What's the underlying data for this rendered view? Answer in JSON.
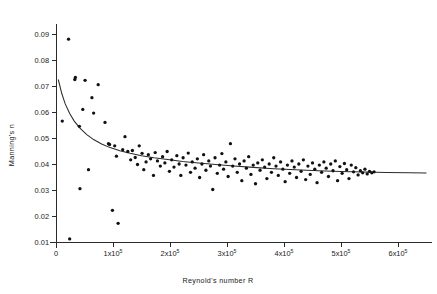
{
  "chart_data": {
    "type": "scatter",
    "title": "",
    "xlabel": "Reynold's number  R",
    "ylabel": "Manning's n",
    "xlim": [
      0,
      650000
    ],
    "ylim": [
      0.008,
      0.094
    ],
    "grid": false,
    "legend": false,
    "x_ticks": [
      {
        "value": 0,
        "label": "0",
        "mantissa": "",
        "exponent": ""
      },
      {
        "value": 100000,
        "label": "1x10",
        "mantissa": "1x10",
        "exponent": "5"
      },
      {
        "value": 200000,
        "label": "2x10",
        "mantissa": "2x10",
        "exponent": "5"
      },
      {
        "value": 300000,
        "label": "3x10",
        "mantissa": "3x10",
        "exponent": "5"
      },
      {
        "value": 400000,
        "label": "4x10",
        "mantissa": "4x10",
        "exponent": "5"
      },
      {
        "value": 500000,
        "label": "5x10",
        "mantissa": "5x10",
        "exponent": "5"
      },
      {
        "value": 600000,
        "label": "6x10",
        "mantissa": "6x10",
        "exponent": "5"
      }
    ],
    "y_ticks": [
      {
        "value": 0.01,
        "label": "0.01"
      },
      {
        "value": 0.02,
        "label": "0.02"
      },
      {
        "value": 0.03,
        "label": "0.03"
      },
      {
        "value": 0.04,
        "label": "0.04"
      },
      {
        "value": 0.05,
        "label": "0.05"
      },
      {
        "value": 0.06,
        "label": "0.06"
      },
      {
        "value": 0.07,
        "label": "0.07"
      },
      {
        "value": 0.08,
        "label": "0.08"
      },
      {
        "value": 0.09,
        "label": "0.09"
      }
    ],
    "series": [
      {
        "name": "Manning's n observations",
        "marker": "circle",
        "color": "#111111",
        "points": [
          [
            11000,
            0.0565
          ],
          [
            22000,
            0.088
          ],
          [
            24000,
            0.0112
          ],
          [
            33000,
            0.0725
          ],
          [
            34000,
            0.0733
          ],
          [
            41000,
            0.0545
          ],
          [
            42000,
            0.0305
          ],
          [
            47000,
            0.061
          ],
          [
            51000,
            0.0722
          ],
          [
            57000,
            0.0378
          ],
          [
            63000,
            0.0655
          ],
          [
            66000,
            0.0596
          ],
          [
            74000,
            0.0705
          ],
          [
            86000,
            0.056
          ],
          [
            92000,
            0.0478
          ],
          [
            94000,
            0.0475
          ],
          [
            99000,
            0.0222
          ],
          [
            103000,
            0.047
          ],
          [
            106000,
            0.043
          ],
          [
            109000,
            0.0172
          ],
          [
            117000,
            0.0455
          ],
          [
            121000,
            0.0505
          ],
          [
            126000,
            0.0448
          ],
          [
            131000,
            0.0416
          ],
          [
            134000,
            0.0452
          ],
          [
            139000,
            0.0425
          ],
          [
            143000,
            0.0398
          ],
          [
            146000,
            0.047
          ],
          [
            151000,
            0.0441
          ],
          [
            154000,
            0.0378
          ],
          [
            158000,
            0.0408
          ],
          [
            162000,
            0.0436
          ],
          [
            166000,
            0.042
          ],
          [
            171000,
            0.0356
          ],
          [
            174000,
            0.0444
          ],
          [
            178000,
            0.0412
          ],
          [
            183000,
            0.0392
          ],
          [
            187000,
            0.0428
          ],
          [
            191000,
            0.0404
          ],
          [
            195000,
            0.0448
          ],
          [
            199000,
            0.0372
          ],
          [
            203000,
            0.0416
          ],
          [
            207000,
            0.0388
          ],
          [
            212000,
            0.0432
          ],
          [
            216000,
            0.04
          ],
          [
            219000,
            0.0356
          ],
          [
            223000,
            0.0424
          ],
          [
            228000,
            0.0396
          ],
          [
            232000,
            0.0442
          ],
          [
            236000,
            0.0368
          ],
          [
            239000,
            0.0408
          ],
          [
            244000,
            0.0384
          ],
          [
            248000,
            0.042
          ],
          [
            252000,
            0.0348
          ],
          [
            256000,
            0.04
          ],
          [
            259000,
            0.0436
          ],
          [
            263000,
            0.0376
          ],
          [
            268000,
            0.0412
          ],
          [
            271000,
            0.0392
          ],
          [
            275000,
            0.0302
          ],
          [
            279000,
            0.0424
          ],
          [
            283000,
            0.0364
          ],
          [
            287000,
            0.0396
          ],
          [
            291000,
            0.044
          ],
          [
            294000,
            0.038
          ],
          [
            298000,
            0.0408
          ],
          [
            302000,
            0.0352
          ],
          [
            306000,
            0.0478
          ],
          [
            310000,
            0.0392
          ],
          [
            314000,
            0.042
          ],
          [
            318000,
            0.0368
          ],
          [
            322000,
            0.04
          ],
          [
            326000,
            0.0336
          ],
          [
            330000,
            0.0412
          ],
          [
            334000,
            0.0384
          ],
          [
            338000,
            0.0428
          ],
          [
            342000,
            0.036
          ],
          [
            346000,
            0.0396
          ],
          [
            350000,
            0.0324
          ],
          [
            354000,
            0.0404
          ],
          [
            358000,
            0.0376
          ],
          [
            362000,
            0.0416
          ],
          [
            366000,
            0.0388
          ],
          [
            370000,
            0.0344
          ],
          [
            374000,
            0.04
          ],
          [
            378000,
            0.0368
          ],
          [
            382000,
            0.0424
          ],
          [
            386000,
            0.0392
          ],
          [
            390000,
            0.0356
          ],
          [
            394000,
            0.0408
          ],
          [
            398000,
            0.038
          ],
          [
            402000,
            0.0332
          ],
          [
            406000,
            0.0396
          ],
          [
            410000,
            0.0364
          ],
          [
            414000,
            0.0412
          ],
          [
            418000,
            0.0388
          ],
          [
            422000,
            0.0348
          ],
          [
            426000,
            0.04
          ],
          [
            430000,
            0.0372
          ],
          [
            434000,
            0.0416
          ],
          [
            438000,
            0.034
          ],
          [
            442000,
            0.0392
          ],
          [
            446000,
            0.036
          ],
          [
            450000,
            0.0404
          ],
          [
            454000,
            0.038
          ],
          [
            458000,
            0.0328
          ],
          [
            462000,
            0.0396
          ],
          [
            466000,
            0.0368
          ],
          [
            470000,
            0.0408
          ],
          [
            474000,
            0.0384
          ],
          [
            478000,
            0.0352
          ],
          [
            482000,
            0.04
          ],
          [
            486000,
            0.0374
          ],
          [
            490000,
            0.0412
          ],
          [
            494000,
            0.0336
          ],
          [
            498000,
            0.039
          ],
          [
            502000,
            0.0364
          ],
          [
            506000,
            0.0402
          ],
          [
            510000,
            0.0378
          ],
          [
            514000,
            0.0344
          ],
          [
            518000,
            0.0396
          ],
          [
            522000,
            0.037
          ],
          [
            526000,
            0.0386
          ],
          [
            530000,
            0.0358
          ],
          [
            534000,
            0.0374
          ],
          [
            538000,
            0.0366
          ],
          [
            542000,
            0.038
          ],
          [
            546000,
            0.0362
          ],
          [
            550000,
            0.0372
          ],
          [
            554000,
            0.0366
          ],
          [
            558000,
            0.037
          ]
        ]
      }
    ],
    "fit_curve": {
      "name": "fitted decay curve",
      "color": "#2b2b2b",
      "asymptote": 0.0365,
      "start_value": 0.0725,
      "points": [
        [
          4000,
          0.0725
        ],
        [
          10000,
          0.0672
        ],
        [
          16000,
          0.0632
        ],
        [
          24000,
          0.0594
        ],
        [
          32000,
          0.0565
        ],
        [
          42000,
          0.0538
        ],
        [
          54000,
          0.0513
        ],
        [
          66000,
          0.0494
        ],
        [
          80000,
          0.0477
        ],
        [
          95000,
          0.0463
        ],
        [
          112000,
          0.0451
        ],
        [
          130000,
          0.0441
        ],
        [
          150000,
          0.0432
        ],
        [
          172000,
          0.0424
        ],
        [
          196000,
          0.0417
        ],
        [
          222000,
          0.041
        ],
        [
          250000,
          0.0404
        ],
        [
          280000,
          0.0398
        ],
        [
          312000,
          0.0392
        ],
        [
          346000,
          0.0387
        ],
        [
          382000,
          0.0382
        ],
        [
          420000,
          0.0378
        ],
        [
          460000,
          0.0374
        ],
        [
          500000,
          0.0371
        ],
        [
          540000,
          0.0369
        ],
        [
          580000,
          0.0367
        ],
        [
          620000,
          0.0366
        ]
      ]
    }
  }
}
